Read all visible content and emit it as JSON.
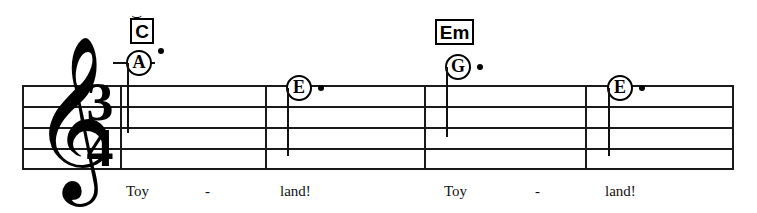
{
  "score": {
    "clef": {
      "name": "treble-clef",
      "glyph": "𝄞"
    },
    "time_signature": {
      "numerator": "3",
      "denominator": "4"
    },
    "staff": {
      "line_count": 5,
      "measure_count": 4
    },
    "chords": [
      {
        "label": "C",
        "has_mark_above": true,
        "mark": "⌣"
      },
      {
        "label": "Em",
        "has_mark_above": false,
        "mark": ""
      }
    ],
    "notes": [
      {
        "letter": "A",
        "dotted": true,
        "ledger_line": true,
        "stem": "down"
      },
      {
        "letter": "E",
        "dotted": true,
        "ledger_line": false,
        "stem": "down"
      },
      {
        "letter": "G",
        "dotted": true,
        "ledger_line": false,
        "stem": "down"
      },
      {
        "letter": "E",
        "dotted": true,
        "ledger_line": false,
        "stem": "down"
      }
    ],
    "lyrics": [
      {
        "text": "Toy"
      },
      {
        "text": "-"
      },
      {
        "text": "land!"
      },
      {
        "text": "Toy"
      },
      {
        "text": "-"
      },
      {
        "text": "land!"
      }
    ],
    "colors": {
      "ink": "#000000",
      "staff": "#1a1a1a",
      "paper": "#ffffff"
    }
  }
}
